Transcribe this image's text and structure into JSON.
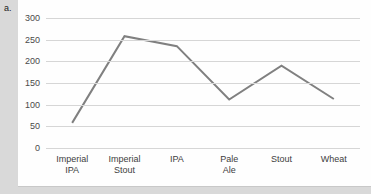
{
  "figure": {
    "label": "a."
  },
  "chart_data": {
    "type": "line",
    "title": "",
    "xlabel": "",
    "ylabel": "",
    "categories": [
      "Imperial IPA",
      "Imperial Stout",
      "IPA",
      "Pale Ale",
      "Stout",
      "Wheat"
    ],
    "values": [
      58,
      258,
      235,
      112,
      190,
      113
    ],
    "series": [
      {
        "name": "",
        "values": [
          58,
          258,
          235,
          112,
          190,
          113
        ],
        "color": "#808080"
      }
    ],
    "ylim": [
      0,
      300
    ],
    "ytick_labels": [
      "0",
      "50",
      "100",
      "150",
      "200",
      "250",
      "300"
    ],
    "ytick_values": [
      0,
      50,
      100,
      150,
      200,
      250,
      300
    ],
    "grid": "horizontal",
    "legend": "none",
    "line_color": "#808080",
    "gridline_color": "#d6d6d6",
    "plot_background": "#fefefe",
    "page_background": "#d9d9d9"
  }
}
